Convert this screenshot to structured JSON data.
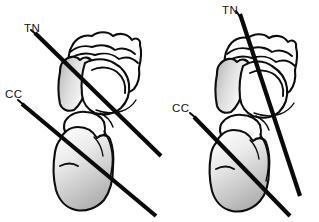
{
  "figure": {
    "background_color": "#ffffff",
    "line_color": "#0a0a0a",
    "shade_light": "#ffffff",
    "shade_mid": "#d2d2d2",
    "shade_dark": "#9b9b9b",
    "width": 319,
    "height": 222
  },
  "panels": [
    {
      "id": "left-panel",
      "name": "parallel-axes-panel",
      "labels": {
        "tn": "TN",
        "cc": "CC"
      },
      "tn_label_pos": {
        "x": 24,
        "y": 32
      },
      "cc_label_pos": {
        "x": 5,
        "y": 98
      },
      "tn_axis": {
        "x1": 35,
        "y1": 33,
        "x2": 161,
        "y2": 156
      },
      "cc_axis": {
        "x1": 22,
        "y1": 104,
        "x2": 156,
        "y2": 216
      },
      "axis_relation": "parallel"
    },
    {
      "id": "right-panel",
      "name": "divergent-axes-panel",
      "labels": {
        "tn": "TN",
        "cc": "CC"
      },
      "tn_label_pos": {
        "x": 222,
        "y": 14
      },
      "cc_label_pos": {
        "x": 172,
        "y": 112
      },
      "tn_axis": {
        "x1": 240,
        "y1": 14,
        "x2": 300,
        "y2": 196
      },
      "cc_axis": {
        "x1": 194,
        "y1": 117,
        "x2": 290,
        "y2": 216
      },
      "axis_relation": "crossing"
    }
  ],
  "legend": {
    "tn_meaning": "TN",
    "cc_meaning": "CC"
  }
}
